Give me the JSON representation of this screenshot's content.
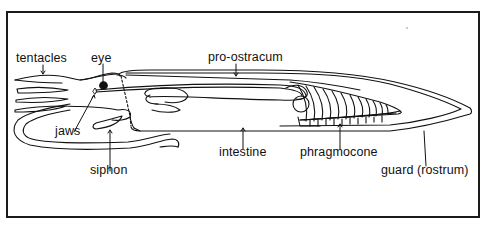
{
  "diagram": {
    "colors": {
      "ink": "#111111",
      "background": "#ffffff",
      "frame": "#1a1a1a"
    },
    "labels": {
      "tentacles": "tentacles",
      "eye": "eye",
      "pro_ostracum": "pro-ostracum",
      "jaws": "jaws",
      "siphon": "siphon",
      "intestine": "intestine",
      "phragmocone": "phragmocone",
      "guard": "guard (rostrum)"
    }
  }
}
